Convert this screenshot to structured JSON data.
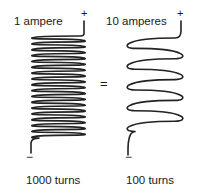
{
  "diagram": {
    "left_solenoid": {
      "current_label": "1 ampere",
      "positive_terminal": "+",
      "negative_terminal": "−",
      "turns_label": "1000 turns",
      "drawn_loops": 18
    },
    "equals_sign": "=",
    "right_solenoid": {
      "current_label": "10 amperes",
      "positive_terminal": "+",
      "negative_terminal": "−",
      "turns_label": "100 turns",
      "drawn_loops": 5
    },
    "colors": {
      "wire": "#222222",
      "text": "#1a1a1a",
      "background": "#ffffff"
    }
  }
}
